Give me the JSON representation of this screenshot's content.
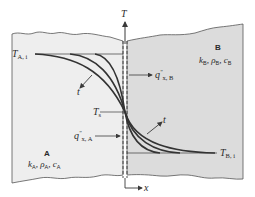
{
  "diagram": {
    "type": "transient-conduction-two-media",
    "colors": {
      "medium_a_fill": "#eeeeee",
      "medium_b_fill": "#dcdcdc",
      "line": "#3a3a3a",
      "text": "#2a2a2a",
      "background": "#ffffff"
    },
    "axes": {
      "vertical_label": "T",
      "horizontal_label": "x"
    },
    "medium_a": {
      "letter": "A",
      "k": "k",
      "k_sub": "A",
      "rho": "ρ",
      "rho_sub": "A",
      "c": "c",
      "c_sub": "A",
      "initial_temp": "T",
      "initial_temp_sub": "A, i",
      "flux": "q",
      "flux_sup": "\"",
      "flux_sub": "x, A"
    },
    "medium_b": {
      "letter": "B",
      "k": "k",
      "k_sub": "B",
      "rho": "ρ",
      "rho_sub": "B",
      "c": "c",
      "c_sub": "B",
      "initial_temp": "T",
      "initial_temp_sub": "B, i",
      "flux": "q",
      "flux_sup": "\"",
      "flux_sub": "x, B"
    },
    "interface": {
      "surface_temp": "T",
      "surface_temp_sub": "s"
    },
    "time_labels": {
      "left": "t",
      "right": "t"
    }
  }
}
